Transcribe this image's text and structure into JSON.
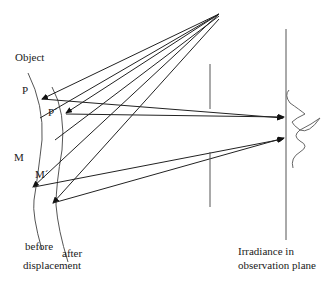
{
  "labels": {
    "object": "Object",
    "point_p": "P",
    "point_p_prime": "P´",
    "point_m": "M",
    "point_m_prime": "M´",
    "before": "before",
    "after": "after",
    "displacement": "displacement",
    "irradiance_line1": "Irradiance in",
    "irradiance_line2": "observation plane"
  },
  "colors": {
    "line": "#333333",
    "surface": "#555555",
    "background": "#ffffff"
  }
}
